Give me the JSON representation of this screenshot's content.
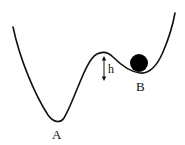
{
  "diagram": {
    "type": "potential-energy-landscape",
    "labels": {
      "global_minimum": "A",
      "local_minimum": "B",
      "barrier_height": "h"
    },
    "colors": {
      "curve": "#111111",
      "ball": "#000000",
      "background": "#ffffff"
    }
  }
}
